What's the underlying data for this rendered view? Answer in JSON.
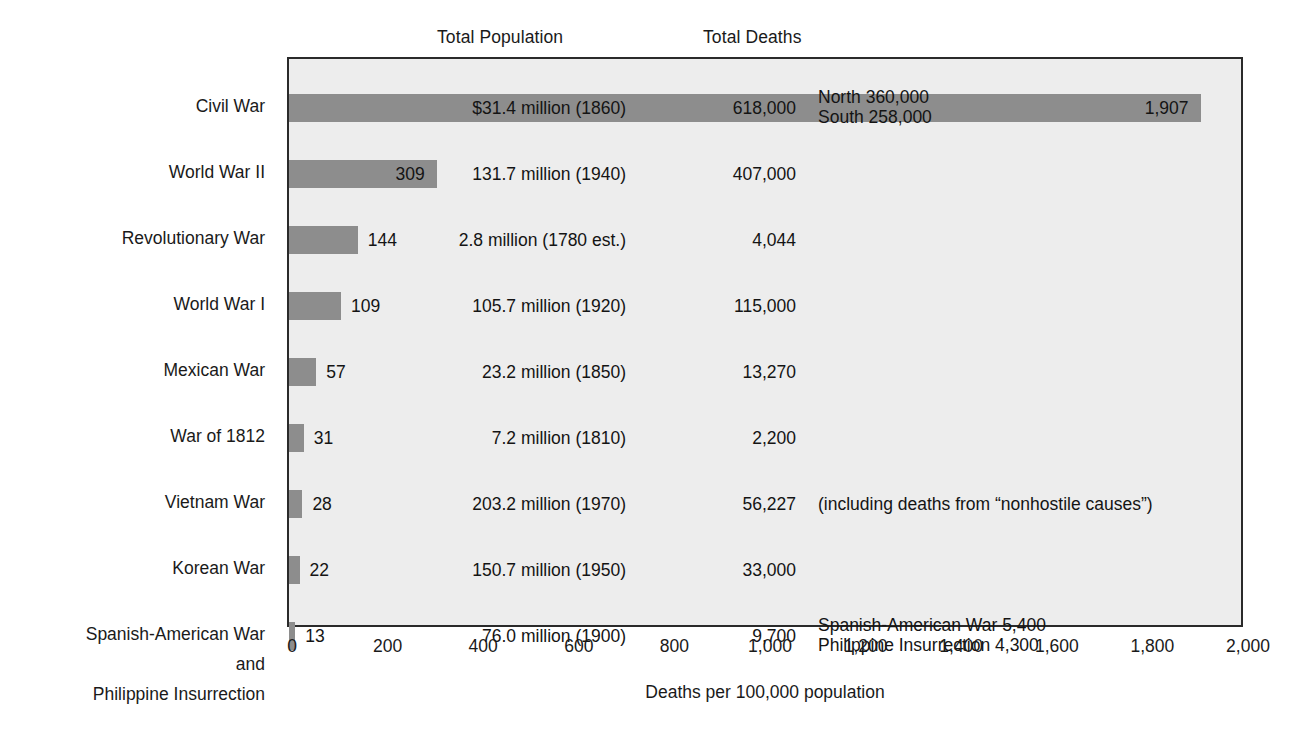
{
  "headers": {
    "population": "Total Population",
    "deaths": "Total Deaths"
  },
  "chart_data": {
    "type": "bar",
    "orientation": "horizontal",
    "title": "",
    "xlabel": "Deaths per 100,000 population",
    "ylabel": "",
    "xlim": [
      0,
      2000
    ],
    "xticks": [
      0,
      200,
      400,
      600,
      800,
      1000,
      1200,
      1400,
      1600,
      1800,
      2000
    ],
    "xticklabels": [
      "0",
      "200",
      "400",
      "600",
      "800",
      "1,000",
      "1,200",
      "1,400",
      "1,600",
      "1,800",
      "2,000"
    ],
    "grid": false,
    "legend": null,
    "categories": [
      "Civil War",
      "World War II",
      "Revolutionary War",
      "World War I",
      "Mexican War",
      "War of 1812",
      "Vietnam War",
      "Korean War",
      "Spanish-American War and Philippine Insurrection"
    ],
    "values": [
      1907,
      309,
      144,
      109,
      57,
      31,
      28,
      22,
      13
    ],
    "bar_color": "#8d8d8d",
    "plot_background": "#ededed",
    "border_color": "#2a2a2a"
  },
  "rows": [
    {
      "label_lines": [
        "Civil War"
      ],
      "value": 1907,
      "value_label": "1,907",
      "population": "$31.4 million (1860)",
      "deaths": "618,000",
      "note_lines": [
        "North 360,000",
        "South 258,000"
      ]
    },
    {
      "label_lines": [
        "World War II"
      ],
      "value": 309,
      "value_label": "309",
      "population": "131.7 million (1940)",
      "deaths": "407,000",
      "note_lines": []
    },
    {
      "label_lines": [
        "Revolutionary War"
      ],
      "value": 144,
      "value_label": "144",
      "population": "2.8 million (1780 est.)",
      "deaths": "4,044",
      "note_lines": []
    },
    {
      "label_lines": [
        "World War I"
      ],
      "value": 109,
      "value_label": "109",
      "population": "105.7 million (1920)",
      "deaths": "115,000",
      "note_lines": []
    },
    {
      "label_lines": [
        "Mexican War"
      ],
      "value": 57,
      "value_label": "57",
      "population": "23.2 million (1850)",
      "deaths": "13,270",
      "note_lines": []
    },
    {
      "label_lines": [
        "War of 1812"
      ],
      "value": 31,
      "value_label": "31",
      "population": "7.2 million (1810)",
      "deaths": "2,200",
      "note_lines": []
    },
    {
      "label_lines": [
        "Vietnam War"
      ],
      "value": 28,
      "value_label": "28",
      "population": "203.2 million (1970)",
      "deaths": "56,227",
      "note_lines": [
        "(including deaths from “nonhostile causes”)"
      ]
    },
    {
      "label_lines": [
        "Korean War"
      ],
      "value": 22,
      "value_label": "22",
      "population": "150.7 million (1950)",
      "deaths": "33,000",
      "note_lines": []
    },
    {
      "label_lines": [
        "Spanish-American War",
        "and",
        "Philippine Insurrection"
      ],
      "value": 13,
      "value_label": "13",
      "population": "76.0 million (1900)",
      "deaths": "9,700",
      "note_lines": [
        "Spanish-American War 5,400",
        "Philippine Insurrection 4,300"
      ]
    }
  ],
  "axis": {
    "title": "Deaths per 100,000 population",
    "ticks": [
      "0",
      "200",
      "400",
      "600",
      "800",
      "1,000",
      "1,200",
      "1,400",
      "1,600",
      "1,800",
      "2,000"
    ]
  }
}
